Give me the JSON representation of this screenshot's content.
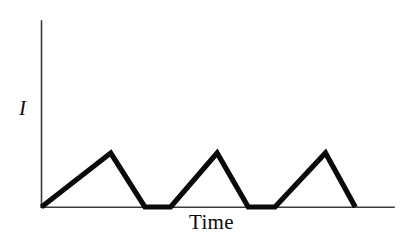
{
  "chart_data": {
    "type": "line",
    "title": "",
    "subtitle": "",
    "xlabel": "Time",
    "ylabel": "I",
    "xlim": [
      0,
      100
    ],
    "ylim": [
      0,
      100
    ],
    "grid": false,
    "legend": null,
    "axis_ticks": {
      "x": [],
      "y": []
    },
    "series": [
      {
        "name": "current",
        "color": "#0a0a0a",
        "description": "Asymmetric sawtooth / triangular pulse train: slow linear rise followed by fast linear fall, repeated three times, returning to zero baseline between pulses.",
        "points": [
          {
            "x": 0.0,
            "y": 0.0
          },
          {
            "x": 20.7,
            "y": 29.0
          },
          {
            "x": 30.9,
            "y": 0.0
          },
          {
            "x": 38.6,
            "y": 0.0
          },
          {
            "x": 52.5,
            "y": 29.0
          },
          {
            "x": 61.8,
            "y": 0.0
          },
          {
            "x": 69.8,
            "y": 0.0
          },
          {
            "x": 84.9,
            "y": 29.0
          },
          {
            "x": 93.8,
            "y": 0.0
          }
        ]
      }
    ],
    "pulses": [
      {
        "index": 1,
        "rise_start_x": 0.0,
        "peak_x": 20.7,
        "peak_y": 29.0,
        "fall_end_x": 30.9
      },
      {
        "index": 2,
        "rise_start_x": 38.6,
        "peak_x": 52.5,
        "peak_y": 29.0,
        "fall_end_x": 61.8
      },
      {
        "index": 3,
        "rise_start_x": 69.8,
        "peak_x": 84.9,
        "peak_y": 29.0,
        "fall_end_x": 93.8
      }
    ],
    "colors": {
      "background": "#ffffff",
      "axis": "#3a3a3a",
      "waveform": "#0a0a0a",
      "label": "#0b0b0b"
    }
  },
  "axes": {
    "y_axis_name": "y-axis",
    "x_axis_name": "x-axis",
    "ylabel": "I",
    "xlabel": "Time"
  }
}
